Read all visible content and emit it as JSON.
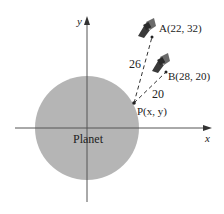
{
  "diagram": {
    "type": "coordinate-geometry",
    "axes": {
      "x_label": "x",
      "y_label": "y"
    },
    "planet": {
      "label": "Planet",
      "color": "#b5b5b5"
    },
    "points": [
      {
        "id": "A",
        "label": "A(22, 32)",
        "x": 22,
        "y": 32,
        "has_satellite": true
      },
      {
        "id": "B",
        "label": "B(28, 20)",
        "x": 28,
        "y": 20,
        "has_satellite": true
      },
      {
        "id": "P",
        "label": "P(x, y)",
        "has_satellite": false
      }
    ],
    "segments": [
      {
        "from": "P",
        "to": "A",
        "length_label": "26",
        "style": "dashed"
      },
      {
        "from": "P",
        "to": "B",
        "length_label": "20",
        "style": "dashed"
      }
    ],
    "colors": {
      "axis": "#555555",
      "ink": "#222222",
      "satellite": "#3a3a3a"
    }
  }
}
